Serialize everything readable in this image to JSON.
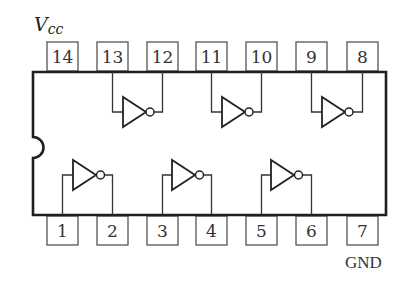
{
  "diagram": {
    "type": "ic-pinout",
    "labels": {
      "vcc_main": "V",
      "vcc_sub": "cc",
      "gnd": "GND"
    },
    "top_pins": [
      "14",
      "13",
      "12",
      "11",
      "10",
      "9",
      "8"
    ],
    "bottom_pins": [
      "1",
      "2",
      "3",
      "4",
      "5",
      "6",
      "7"
    ],
    "gates": [
      {
        "type": "NOT",
        "input_pin": "13",
        "output_pin": "12",
        "row": "top"
      },
      {
        "type": "NOT",
        "input_pin": "11",
        "output_pin": "10",
        "row": "top"
      },
      {
        "type": "NOT",
        "input_pin": "9",
        "output_pin": "8",
        "row": "top"
      },
      {
        "type": "NOT",
        "input_pin": "1",
        "output_pin": "2",
        "row": "bottom"
      },
      {
        "type": "NOT",
        "input_pin": "3",
        "output_pin": "4",
        "row": "bottom"
      },
      {
        "type": "NOT",
        "input_pin": "5",
        "output_pin": "6",
        "row": "bottom"
      }
    ],
    "power_pin": "14",
    "ground_pin": "7",
    "colors": {
      "line": "#222222",
      "box": "#555555",
      "background": "#ffffff"
    }
  }
}
